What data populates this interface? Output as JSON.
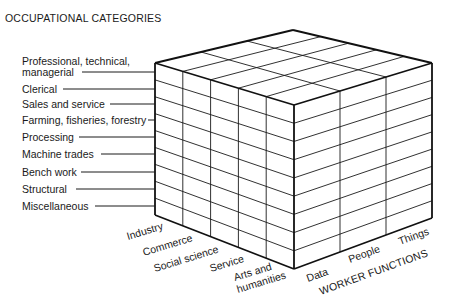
{
  "title": "OCCUPATIONAL CATEGORIES",
  "occupational_categories": [
    {
      "line1": "Professional, technical,",
      "line2": "managerial"
    },
    {
      "line1": "Clerical"
    },
    {
      "line1": "Sales and service"
    },
    {
      "line1": "Farming, fisheries, forestry"
    },
    {
      "line1": "Processing"
    },
    {
      "line1": "Machine trades"
    },
    {
      "line1": "Bench work"
    },
    {
      "line1": "Structural"
    },
    {
      "line1": "Miscellaneous"
    }
  ],
  "interest_areas": [
    {
      "line1": "Industry"
    },
    {
      "line1": "Commerce"
    },
    {
      "line1": "Social science"
    },
    {
      "line1": "Service"
    },
    {
      "line1": "Arts and",
      "line2": "humanities"
    }
  ],
  "worker_functions_title": "WORKER FUNCTIONS",
  "worker_functions": [
    "Data",
    "People",
    "Things"
  ],
  "colors": {
    "line": "#1a1a1a",
    "background": "#ffffff"
  }
}
